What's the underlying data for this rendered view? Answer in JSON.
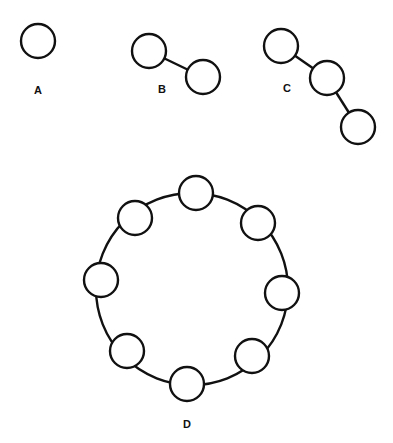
{
  "diagram": {
    "title": "",
    "colors": {
      "stroke": "#111111",
      "background": "#ffffff"
    },
    "node_radius": 17,
    "graphs": [
      {
        "label": "A",
        "label_pos": [
          38,
          94
        ],
        "nodes": [
          [
            38,
            41
          ]
        ],
        "edges": []
      },
      {
        "label": "B",
        "label_pos": [
          162,
          93
        ],
        "nodes": [
          [
            149,
            51
          ],
          [
            203,
            77
          ]
        ],
        "edges": [
          [
            0,
            1
          ]
        ]
      },
      {
        "label": "C",
        "label_pos": [
          287,
          92
        ],
        "nodes": [
          [
            281,
            46
          ],
          [
            327,
            78
          ],
          [
            358,
            127
          ]
        ],
        "edges": [
          [
            0,
            1
          ],
          [
            1,
            2
          ]
        ]
      },
      {
        "label": "D",
        "label_pos": [
          187,
          428
        ],
        "ring": {
          "cx": 192,
          "cy": 289,
          "r": 96
        },
        "nodes": [
          [
            196,
            193
          ],
          [
            258,
            223
          ],
          [
            282,
            293
          ],
          [
            252,
            356
          ],
          [
            187,
            384
          ],
          [
            127,
            351
          ],
          [
            101,
            280
          ],
          [
            135,
            218
          ]
        ],
        "edges": "ring"
      }
    ]
  }
}
